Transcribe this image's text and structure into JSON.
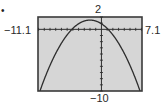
{
  "bullet": "•",
  "window": {
    "xmin": -11.1,
    "xmax": 7.1,
    "ymin": -10,
    "ymax": 2,
    "xmin_label": "−11.1",
    "xmax_label": "7.1",
    "ymin_label": "−10",
    "ymax_label": "2"
  },
  "colors": {
    "screen_bg": "#d6d6d6",
    "frame": "#3a3a3a",
    "curve": "#2e2e2e",
    "axis": "#2e2e2e"
  },
  "chart_data": {
    "type": "line",
    "title": "",
    "xlabel": "",
    "ylabel": "",
    "xlim": [
      -11.1,
      7.1
    ],
    "ylim": [
      -10,
      2
    ],
    "grid": false,
    "axes_tick_marks": true,
    "tick_labels": {
      "left": "−11.1",
      "right": "7.1",
      "top": "2",
      "bottom": "−10"
    },
    "series": [
      {
        "name": "parabola",
        "function": "y = -0.15(x + 2)^2 + 1.5",
        "vertex": [
          -2,
          1.5
        ],
        "x": [
          -10.75,
          -9,
          -7,
          -5.16,
          -4,
          -3,
          -2,
          -1,
          0,
          1.16,
          3,
          5,
          6.75
        ],
        "y": [
          -10,
          -5.85,
          -2.25,
          0,
          0.9,
          1.35,
          1.5,
          1.35,
          0.9,
          0,
          -2.25,
          -5.85,
          -10
        ]
      }
    ]
  }
}
